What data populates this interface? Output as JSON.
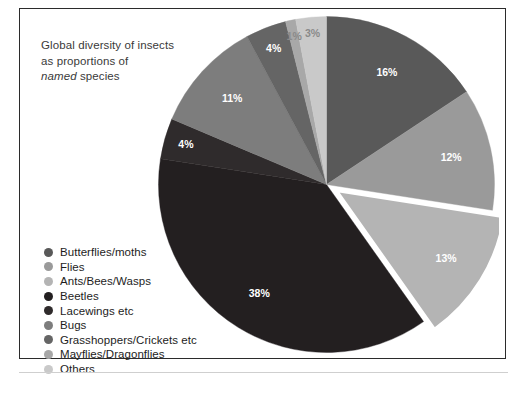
{
  "figure": {
    "caption_line1": "Global diversity of insects",
    "caption_line2": "as proportions of",
    "caption_emphasis": "named",
    "caption_line3_rest": " species",
    "border_color": "#2b2b2b",
    "background": "#ffffff"
  },
  "chart_data": {
    "type": "pie",
    "title": "Global diversity of insects as proportions of named species",
    "xlabel": "",
    "ylabel": "",
    "units": "percent",
    "legend_position": "left-bottom",
    "grid": false,
    "start_angle_deg": -90,
    "direction": "clockwise",
    "exploded_slice": "Ants/Bees/Wasps",
    "categories": [
      "Butterflies/moths",
      "Flies",
      "Ants/Bees/Wasps",
      "Beetles",
      "Lacewings etc",
      "Bugs",
      "Grasshoppers/Crickets etc",
      "Mayflies/Dragonflies",
      "Others"
    ],
    "values": [
      16,
      12,
      13,
      38,
      4,
      11,
      4,
      1,
      3
    ],
    "labels": [
      "16%",
      "12%",
      "13%",
      "38%",
      "4%",
      "11%",
      "4%",
      "1%",
      "3%"
    ],
    "colors": [
      "#595959",
      "#9a9a9a",
      "#b4b4b4",
      "#231f20",
      "#2f2b2c",
      "#7d7d7d",
      "#656565",
      "#a8a8a8",
      "#c9c9c9"
    ],
    "label_text_colors": [
      "#ffffff",
      "#ffffff",
      "#ffffff",
      "#ffffff",
      "#ffffff",
      "#ffffff",
      "#ffffff",
      "#8a8a8a",
      "#8a8a8a"
    ]
  },
  "legend": {
    "items": [
      {
        "label": "Butterflies/moths",
        "color": "#595959"
      },
      {
        "label": "Flies",
        "color": "#9a9a9a"
      },
      {
        "label": "Ants/Bees/Wasps",
        "color": "#b4b4b4"
      },
      {
        "label": "Beetles",
        "color": "#231f20"
      },
      {
        "label": "Lacewings etc",
        "color": "#2f2b2c"
      },
      {
        "label": "Bugs",
        "color": "#7d7d7d"
      },
      {
        "label": "Grasshoppers/Crickets etc",
        "color": "#656565"
      },
      {
        "label": "Mayflies/Dragonflies",
        "color": "#a8a8a8"
      },
      {
        "label": "Others",
        "color": "#c9c9c9"
      }
    ]
  }
}
